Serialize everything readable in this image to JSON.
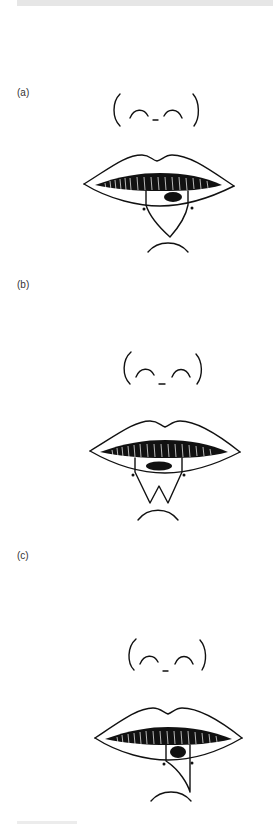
{
  "figure": {
    "panels": [
      {
        "label": "(a)",
        "variant": "pointed-triangle"
      },
      {
        "label": "(b)",
        "variant": "w-shape"
      },
      {
        "label": "(c)",
        "variant": "curved-line"
      }
    ],
    "colors": {
      "ink": "#111111",
      "background": "#ffffff",
      "header_bar": "#e6e6e6"
    }
  }
}
